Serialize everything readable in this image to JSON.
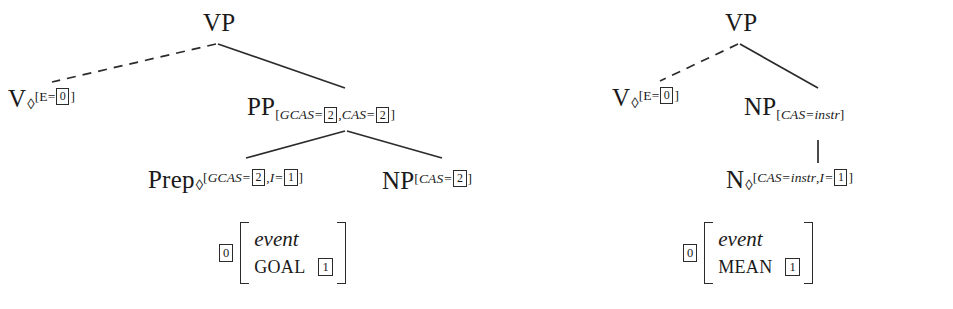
{
  "figure": {
    "kind": "ltag-elementary-trees",
    "background": "#ffffff",
    "ink": "#1a1a1a",
    "tree_count": 2
  },
  "left_tree": {
    "name": "goal-pp-tree",
    "root": {
      "cat": "VP",
      "decoration": ""
    },
    "anchor": {
      "cat": "V",
      "diamond": "◊",
      "features": "[E=",
      "features_tail": "]",
      "tag": "0"
    },
    "pp": {
      "cat": "PP",
      "feat_open": "[",
      "feat_a": "GCAS=",
      "tag_a": "2",
      "feat_sep": ",",
      "feat_b": "CAS=",
      "tag_b": "2",
      "feat_close": "]"
    },
    "prep": {
      "cat": "Prep",
      "diamond": "◊",
      "feat_open": "[",
      "feat_a": "GCAS=",
      "tag_a": "2",
      "feat_sep": ",",
      "feat_b": "I=",
      "tag_b": "1",
      "feat_close": "]"
    },
    "np": {
      "cat": "NP",
      "feat_open": "[",
      "feat_a": "CAS=",
      "tag_a": "2",
      "feat_close": "]"
    },
    "avm": {
      "index": "0",
      "type": "event",
      "attribute": "GOAL",
      "value": "1"
    },
    "edges": [
      {
        "from": "VP",
        "to": "V",
        "style": "dashed"
      },
      {
        "from": "VP",
        "to": "PP",
        "style": "solid"
      },
      {
        "from": "PP",
        "to": "Prep",
        "style": "solid"
      },
      {
        "from": "PP",
        "to": "NP",
        "style": "solid"
      }
    ]
  },
  "right_tree": {
    "name": "mean-np-tree",
    "root": {
      "cat": "VP",
      "decoration": ""
    },
    "anchor": {
      "cat": "V",
      "diamond": "◊",
      "features": "[E=",
      "features_tail": "]",
      "tag": "0"
    },
    "np": {
      "cat": "NP",
      "feat_open": "[",
      "feat_a": "CAS=instr",
      "feat_close": "]"
    },
    "n": {
      "cat": "N",
      "diamond": "◊",
      "feat_open": "[",
      "feat_a": "CAS=instr",
      "feat_sep": ",",
      "feat_b": "I=",
      "tag_b": "1",
      "feat_close": "]"
    },
    "avm": {
      "index": "0",
      "type": "event",
      "attribute": "MEAN",
      "value": "1"
    },
    "edges": [
      {
        "from": "VP",
        "to": "V",
        "style": "dashed"
      },
      {
        "from": "VP",
        "to": "NP",
        "style": "solid"
      },
      {
        "from": "NP",
        "to": "N",
        "style": "solid-vertical"
      }
    ]
  }
}
